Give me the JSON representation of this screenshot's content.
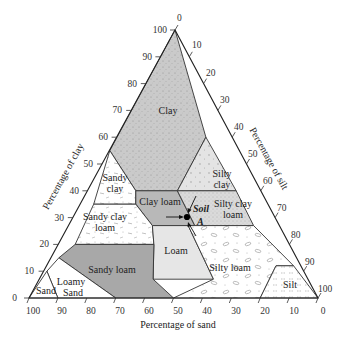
{
  "figure": {
    "type": "soil-texture-triangle",
    "clay_axis": {
      "title": "Percentage of clay",
      "ticks": [
        "0",
        "10",
        "20",
        "30",
        "40",
        "50",
        "60",
        "70",
        "80",
        "90",
        "100"
      ]
    },
    "silt_axis": {
      "title": "Percentage of silt",
      "ticks": [
        "0",
        "10",
        "20",
        "30",
        "40",
        "50",
        "60",
        "70",
        "80",
        "90",
        "100"
      ]
    },
    "sand_axis": {
      "title": "Percentage of sand",
      "ticks": [
        "100",
        "90",
        "80",
        "70",
        "60",
        "50",
        "40",
        "30",
        "20",
        "10",
        "0"
      ]
    },
    "regions": {
      "clay": "Clay",
      "silty_clay_1": "Silty",
      "silty_clay_2": "clay",
      "sandy_clay_1": "Sandy",
      "sandy_clay_2": "clay",
      "clay_loam": "Clay loam",
      "silty_clay_loam_1": "Silty clay",
      "silty_clay_loam_2": "loam",
      "sandy_clay_loam_1": "Sandy clay",
      "sandy_clay_loam_2": "loam",
      "loam": "Loam",
      "silty_loam": "Silty loam",
      "sandy_loam": "Sandy loam",
      "loamy_sand_1": "Loamy",
      "loamy_sand_2": "Sand",
      "sand": "Sand",
      "silt": "Silt"
    },
    "point": {
      "label_1": "Soil",
      "label_2": "A",
      "clay_pct": 35,
      "sand_pct": 35,
      "silt_pct": 30
    },
    "colors": {
      "clay": "#c9c9c9",
      "clay_loam": "#b8b8b8",
      "sandy_loam": "#a8a8a8",
      "loam": "#e6e6e6",
      "silty_clay": "#e2e2e2",
      "silty_clay_loam": "#d8d8d8",
      "white": "#ffffff",
      "line": "#333333"
    }
  }
}
